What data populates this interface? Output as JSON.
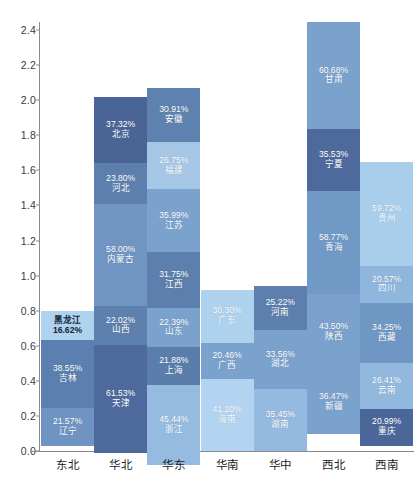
{
  "chart_data": {
    "type": "bar",
    "title": "",
    "xlabel": "",
    "ylabel": "",
    "stacked": true,
    "grid": false,
    "legend": "none",
    "ylim": [
      0.0,
      2.5
    ],
    "yticks": [
      "0.0",
      "0.2",
      "0.4",
      "0.6",
      "0.8",
      "1.0",
      "1.2",
      "1.4",
      "1.6",
      "1.8",
      "2.0",
      "2.2",
      "2.4"
    ],
    "ytick_values": [
      0.0,
      0.2,
      0.4,
      0.6,
      0.8,
      1.0,
      1.2,
      1.4,
      1.6,
      1.8,
      2.0,
      2.2,
      2.4
    ],
    "categories": [
      "东北",
      "华北",
      "华东",
      "华南",
      "华中",
      "西北",
      "西南"
    ],
    "totals": [
      0.7983,
      2.0167,
      2.0703,
      0.9196,
      0.9423,
      2.4445,
      1.6494
    ],
    "series": [
      {
        "category": "东北",
        "total": 0.7983,
        "segments": [
          {
            "name": "黑龙江",
            "label": "16.62%",
            "value": 0.1662,
            "color": "#aed3ee",
            "text": "dark",
            "order": "name-first"
          },
          {
            "name": "吉林",
            "label": "38.55%",
            "value": 0.3855,
            "color": "#5b7fae",
            "text": "light",
            "order": "pct-first"
          },
          {
            "name": "辽宁",
            "label": "21.57%",
            "value": 0.2157,
            "color": "#6f93c2",
            "text": "light",
            "order": "pct-first"
          }
        ]
      },
      {
        "category": "华北",
        "total": 2.0167,
        "segments": [
          {
            "name": "北京",
            "label": "37.32%",
            "value": 0.3732,
            "color": "#4a6496",
            "text": "light",
            "order": "pct-first"
          },
          {
            "name": "河北",
            "label": "23.80%",
            "value": 0.238,
            "color": "#5d7fad",
            "text": "light",
            "order": "pct-first"
          },
          {
            "name": "内蒙古",
            "label": "58.00%",
            "value": 0.58,
            "color": "#7095c2",
            "text": "light",
            "order": "pct-first"
          },
          {
            "name": "山西",
            "label": "22.02%",
            "value": 0.2202,
            "color": "#5e80af",
            "text": "light",
            "order": "pct-first"
          },
          {
            "name": "天津",
            "label": "61.53%",
            "value": 0.6153,
            "color": "#4e6a9c",
            "text": "light",
            "order": "pct-first"
          }
        ]
      },
      {
        "category": "华东",
        "total": 2.0703,
        "segments": [
          {
            "name": "安徽",
            "label": "30.91%",
            "value": 0.3091,
            "color": "#5f81b0",
            "text": "light",
            "order": "pct-first"
          },
          {
            "name": "福建",
            "label": "26.75%",
            "value": 0.2675,
            "color": "#a6c6e6",
            "text": "light",
            "order": "pct-first"
          },
          {
            "name": "江苏",
            "label": "35.99%",
            "value": 0.3599,
            "color": "#7ba2cd",
            "text": "light",
            "order": "pct-first"
          },
          {
            "name": "江西",
            "label": "31.75%",
            "value": 0.3175,
            "color": "#5d7fad",
            "text": "light",
            "order": "pct-first"
          },
          {
            "name": "山东",
            "label": "22.39%",
            "value": 0.2239,
            "color": "#7ba2cd",
            "text": "light",
            "order": "pct-first"
          },
          {
            "name": "上海",
            "label": "21.88%",
            "value": 0.2188,
            "color": "#5b7dab",
            "text": "light",
            "order": "pct-first"
          },
          {
            "name": "浙江",
            "label": "45.44%",
            "value": 0.4544,
            "color": "#96bbe0",
            "text": "light",
            "order": "pct-first"
          }
        ]
      },
      {
        "category": "华南",
        "total": 0.9196,
        "segments": [
          {
            "name": "广东",
            "label": "30.30%",
            "value": 0.303,
            "color": "#aed1ee",
            "text": "light",
            "order": "pct-first"
          },
          {
            "name": "广西",
            "label": "20.46%",
            "value": 0.2046,
            "color": "#7ba2cd",
            "text": "light",
            "order": "pct-first"
          },
          {
            "name": "海南",
            "label": "41.20%",
            "value": 0.412,
            "color": "#b2d4f0",
            "text": "light",
            "order": "pct-first"
          }
        ]
      },
      {
        "category": "华中",
        "total": 0.9423,
        "segments": [
          {
            "name": "河南",
            "label": "25.22%",
            "value": 0.2522,
            "color": "#5d7fad",
            "text": "light",
            "order": "pct-first"
          },
          {
            "name": "湖北",
            "label": "33.56%",
            "value": 0.3356,
            "color": "#7ba2cd",
            "text": "light",
            "order": "pct-first"
          },
          {
            "name": "湖南",
            "label": "35.45%",
            "value": 0.3545,
            "color": "#95badf",
            "text": "light",
            "order": "pct-first"
          }
        ]
      },
      {
        "category": "西北",
        "total": 2.4445,
        "segments": [
          {
            "name": "甘肃",
            "label": "60.68%",
            "value": 0.6068,
            "color": "#7ba2cd",
            "text": "light",
            "order": "pct-first"
          },
          {
            "name": "宁夏",
            "label": "35.53%",
            "value": 0.3553,
            "color": "#4e6a9c",
            "text": "light",
            "order": "pct-first"
          },
          {
            "name": "青海",
            "label": "58.77%",
            "value": 0.5877,
            "color": "#7099c6",
            "text": "light",
            "order": "pct-first"
          },
          {
            "name": "陕西",
            "label": "43.50%",
            "value": 0.435,
            "color": "#7ba2cd",
            "text": "light",
            "order": "pct-first"
          },
          {
            "name": "新疆",
            "label": "36.47%",
            "value": 0.3647,
            "color": "#7ba2cd",
            "text": "light",
            "order": "pct-first"
          }
        ]
      },
      {
        "category": "西南",
        "total": 1.6494,
        "segments": [
          {
            "name": "贵州",
            "label": "59.72%",
            "value": 0.5972,
            "color": "#a9ceec",
            "text": "light",
            "order": "pct-first"
          },
          {
            "name": "四川",
            "label": "20.57%",
            "value": 0.2057,
            "color": "#8fb6dd",
            "text": "light",
            "order": "pct-first"
          },
          {
            "name": "西藏",
            "label": "34.25%",
            "value": 0.3425,
            "color": "#6f97c4",
            "text": "light",
            "order": "pct-first"
          },
          {
            "name": "云南",
            "label": "26.41%",
            "value": 0.2641,
            "color": "#93b8de",
            "text": "light",
            "order": "pct-first"
          },
          {
            "name": "重庆",
            "label": "20.99%",
            "value": 0.2099,
            "color": "#4b679a",
            "text": "light",
            "order": "pct-first"
          }
        ]
      }
    ]
  },
  "layout": {
    "plot_left": 40,
    "plot_top": 22,
    "plot_bottom": 451,
    "plot_width": 374,
    "bar_width": 53,
    "bar_pitch": 53.2,
    "first_bar_left": 41,
    "px_per_unit": 175.4
  }
}
